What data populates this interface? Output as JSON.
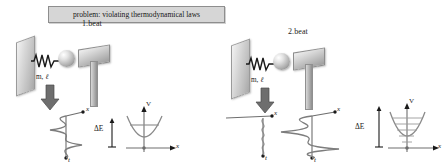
{
  "figure": {
    "background": "#ffffff",
    "accent": "#6e6e6e",
    "ink": "#1a1a1a"
  },
  "callout": {
    "text": "problem: violating thermodynamical laws",
    "fill": "#d6d6d6",
    "border": "#8e8e8e"
  },
  "panels": [
    {
      "id": "panel-left",
      "title": "1.beat",
      "apparatus": {
        "mass_label": "m, ",
        "mass_label_italic": "ℓ",
        "parts": [
          "wall",
          "spring",
          "ball",
          "hammer-head",
          "hammer-handle"
        ],
        "arrow": "down-arrow-icon"
      },
      "waveplot": {
        "x_axis_label": "x",
        "t_axis_label": "t",
        "amplitude_desc": "medium",
        "cycles": 3
      },
      "potential": {
        "v_axis_label": "V",
        "x_axis_label": "x",
        "energy_label": "ΔE",
        "levels": 1
      }
    },
    {
      "id": "panel-right",
      "title": "2.beat",
      "apparatus": {
        "mass_label": "m, ",
        "mass_label_italic": "ℓ",
        "parts": [
          "wall",
          "spring",
          "ball",
          "hammer-head",
          "hammer-handle"
        ],
        "arrow": "down-arrow-icon"
      },
      "waveplot_small": {
        "x_axis_label": "x",
        "t_axis_label": "t",
        "amplitude_desc": "small",
        "cycles": 6
      },
      "waveplot_large": {
        "x_axis_label": "x",
        "t_axis_label": "t",
        "amplitude_desc": "large",
        "cycles": 3
      },
      "potential": {
        "v_axis_label": "V",
        "x_axis_label": "x",
        "energy_label": "ΔE",
        "levels": 5
      }
    }
  ]
}
